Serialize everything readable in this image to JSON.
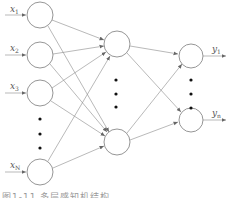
{
  "diagram": {
    "type": "neural-network",
    "colors": {
      "stroke": "#8a8a8a",
      "dots": "#111111",
      "label": "#555555"
    },
    "input_layer": {
      "nodes": [
        {
          "id": "x1",
          "label": "x",
          "sub": "1"
        },
        {
          "id": "x2",
          "label": "x",
          "sub": "2"
        },
        {
          "id": "x3",
          "label": "x",
          "sub": "3"
        },
        {
          "id": "xN",
          "label": "x",
          "sub": "N"
        }
      ],
      "ellipsis": "⋮"
    },
    "hidden_layer": {
      "nodes": [
        {
          "id": "h1"
        },
        {
          "id": "hm"
        }
      ],
      "ellipsis": "⋮"
    },
    "output_layer": {
      "nodes": [
        {
          "id": "y1",
          "label": "y",
          "sub": "1"
        },
        {
          "id": "yn",
          "label": "y",
          "sub": "n"
        }
      ],
      "ellipsis": "⋮"
    },
    "connections": "fully-connected"
  },
  "caption": "图1-11 多层感知机结构"
}
